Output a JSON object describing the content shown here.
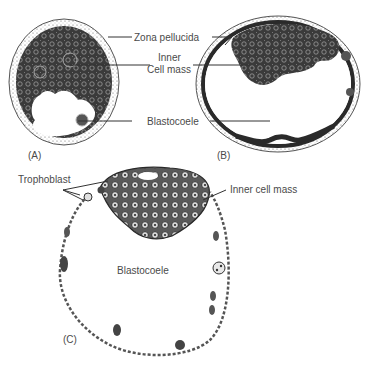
{
  "figure": {
    "panels": [
      {
        "id": "A",
        "label": "(A)"
      },
      {
        "id": "B",
        "label": "(B)"
      },
      {
        "id": "C",
        "label": "(C)"
      }
    ],
    "labels_ab": {
      "zona_pellucida": "Zona pellucida",
      "inner_cell_mass_1": "Inner",
      "inner_cell_mass_2": "Cell mass",
      "blastocoele": "Blastocoele"
    },
    "labels_c": {
      "trophoblast": "Trophoblast",
      "inner_cell_mass": "Inner cell mass",
      "blastocoele": "Blastocoele"
    },
    "colors": {
      "ink": "#2a2a2a",
      "text": "#4a4a4a",
      "cell_dark": "#3a3a3a",
      "background": "#ffffff"
    }
  }
}
